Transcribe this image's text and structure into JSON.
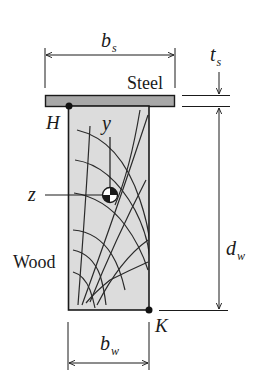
{
  "figure": {
    "type": "composite cross-section",
    "materials": {
      "steel_label": "Steel",
      "wood_label": "Wood"
    },
    "points": {
      "H": "H",
      "K": "K"
    },
    "axes": {
      "y": "y",
      "z": "z"
    },
    "dimensions": {
      "bs": {
        "main": "b",
        "sub": "s"
      },
      "ts": {
        "main": "t",
        "sub": "s"
      },
      "dw": {
        "main": "d",
        "sub": "w"
      },
      "bw": {
        "main": "b",
        "sub": "w"
      }
    },
    "colors": {
      "steel_fill": "#a8a8a8",
      "wood_fill": "#dcdcdc",
      "line": "#1a1a1a",
      "background": "#ffffff"
    }
  }
}
